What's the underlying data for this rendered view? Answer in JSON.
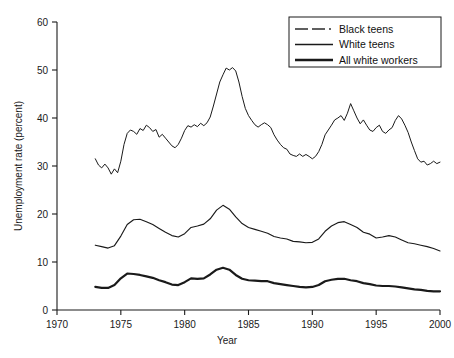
{
  "chart_data": {
    "type": "line",
    "title": "",
    "xlabel": "Year",
    "ylabel": "Unemployment rate (percent)",
    "xlim": [
      1970,
      2000
    ],
    "ylim": [
      0,
      60
    ],
    "xticks": [
      1970,
      1975,
      1980,
      1985,
      1990,
      1995,
      2000
    ],
    "yticks": [
      0,
      10,
      20,
      30,
      40,
      50,
      60
    ],
    "grid": false,
    "legend_position": "top-right",
    "series": [
      {
        "name": "Black teens",
        "style": "dashed",
        "x": [
          1973.0,
          1973.25,
          1973.5,
          1973.75,
          1974.0,
          1974.25,
          1974.5,
          1974.75,
          1975.0,
          1975.25,
          1975.5,
          1975.75,
          1976.0,
          1976.25,
          1976.5,
          1976.75,
          1977.0,
          1977.25,
          1977.5,
          1977.75,
          1978.0,
          1978.25,
          1978.5,
          1978.75,
          1979.0,
          1979.25,
          1979.5,
          1979.75,
          1980.0,
          1980.25,
          1980.5,
          1980.75,
          1981.0,
          1981.25,
          1981.5,
          1981.75,
          1982.0,
          1982.25,
          1982.5,
          1982.75,
          1983.0,
          1983.25,
          1983.5,
          1983.75,
          1984.0,
          1984.25,
          1984.5,
          1984.75,
          1985.0,
          1985.25,
          1985.5,
          1985.75,
          1986.0,
          1986.25,
          1986.5,
          1986.75,
          1987.0,
          1987.25,
          1987.5,
          1987.75,
          1988.0,
          1988.25,
          1988.5,
          1988.75,
          1989.0,
          1989.25,
          1989.5,
          1989.75,
          1990.0,
          1990.25,
          1990.5,
          1990.75,
          1991.0,
          1991.25,
          1991.5,
          1991.75,
          1992.0,
          1992.25,
          1992.5,
          1992.75,
          1993.0,
          1993.25,
          1993.5,
          1993.75,
          1994.0,
          1994.25,
          1994.5,
          1994.75,
          1995.0,
          1995.25,
          1995.5,
          1995.75,
          1996.0,
          1996.25,
          1996.5,
          1996.75,
          1997.0,
          1997.25,
          1997.5,
          1997.75,
          1998.0,
          1998.25,
          1998.5,
          1998.75,
          1999.0,
          1999.25,
          1999.5,
          1999.75,
          2000.0
        ],
        "values": [
          31.5,
          30.2,
          29.6,
          30.4,
          29.6,
          28.3,
          29.4,
          28.6,
          31.0,
          34.5,
          36.8,
          37.5,
          37.2,
          36.6,
          37.8,
          37.4,
          38.5,
          38.0,
          37.2,
          37.6,
          36.0,
          36.6,
          35.8,
          35.0,
          34.2,
          33.8,
          34.5,
          35.8,
          37.4,
          38.4,
          38.1,
          38.6,
          38.2,
          38.9,
          38.4,
          39.0,
          40.2,
          42.5,
          45.0,
          47.5,
          49.0,
          50.4,
          50.0,
          50.5,
          49.8,
          47.5,
          44.5,
          42.0,
          40.5,
          39.5,
          38.6,
          38.1,
          38.6,
          39.0,
          38.6,
          38.0,
          36.5,
          35.4,
          34.5,
          33.8,
          33.5,
          32.5,
          32.2,
          32.0,
          32.5,
          32.0,
          32.4,
          32.0,
          31.5,
          32.0,
          33.0,
          34.5,
          36.5,
          37.5,
          38.5,
          39.6,
          40.0,
          40.5,
          39.5,
          41.0,
          43.0,
          41.5,
          40.0,
          38.8,
          39.6,
          38.5,
          37.5,
          37.2,
          38.0,
          38.5,
          37.2,
          36.8,
          37.5,
          38.0,
          39.5,
          40.5,
          39.8,
          38.5,
          37.0,
          35.0,
          33.2,
          31.5,
          30.8,
          31.0,
          30.2,
          30.5,
          31.0,
          30.5,
          30.8
        ]
      },
      {
        "name": "White teens",
        "style": "thin-solid",
        "x": [
          1973.0,
          1973.5,
          1974.0,
          1974.5,
          1975.0,
          1975.5,
          1976.0,
          1976.5,
          1977.0,
          1977.5,
          1978.0,
          1978.5,
          1979.0,
          1979.5,
          1980.0,
          1980.5,
          1981.0,
          1981.5,
          1982.0,
          1982.5,
          1983.0,
          1983.5,
          1984.0,
          1984.5,
          1985.0,
          1985.5,
          1986.0,
          1986.5,
          1987.0,
          1987.5,
          1988.0,
          1988.5,
          1989.0,
          1989.5,
          1990.0,
          1990.5,
          1991.0,
          1991.5,
          1992.0,
          1992.5,
          1993.0,
          1993.5,
          1994.0,
          1994.5,
          1995.0,
          1995.5,
          1996.0,
          1996.5,
          1997.0,
          1997.5,
          1998.0,
          1998.5,
          1999.0,
          1999.5,
          2000.0
        ],
        "values": [
          13.5,
          13.2,
          12.9,
          13.4,
          15.4,
          17.8,
          18.8,
          18.9,
          18.4,
          17.8,
          17.0,
          16.2,
          15.5,
          15.2,
          15.9,
          17.2,
          17.5,
          17.9,
          19.0,
          20.8,
          21.8,
          21.0,
          19.4,
          18.0,
          17.2,
          16.8,
          16.4,
          16.0,
          15.3,
          15.0,
          14.8,
          14.3,
          14.2,
          14.0,
          14.1,
          14.8,
          16.4,
          17.5,
          18.2,
          18.4,
          17.8,
          17.2,
          16.2,
          15.8,
          15.0,
          15.2,
          15.5,
          15.2,
          14.6,
          14.0,
          13.8,
          13.5,
          13.2,
          12.8,
          12.3
        ]
      },
      {
        "name": "All white workers",
        "style": "thick-solid",
        "x": [
          1973.0,
          1973.5,
          1974.0,
          1974.5,
          1975.0,
          1975.5,
          1976.0,
          1976.5,
          1977.0,
          1977.5,
          1978.0,
          1978.5,
          1979.0,
          1979.5,
          1980.0,
          1980.5,
          1981.0,
          1981.5,
          1982.0,
          1982.5,
          1983.0,
          1983.5,
          1984.0,
          1984.5,
          1985.0,
          1985.5,
          1986.0,
          1986.5,
          1987.0,
          1987.5,
          1988.0,
          1988.5,
          1989.0,
          1989.5,
          1990.0,
          1990.5,
          1991.0,
          1991.5,
          1992.0,
          1992.5,
          1993.0,
          1993.5,
          1994.0,
          1994.5,
          1995.0,
          1995.5,
          1996.0,
          1996.5,
          1997.0,
          1997.5,
          1998.0,
          1998.5,
          1999.0,
          1999.5,
          2000.0
        ],
        "values": [
          4.8,
          4.6,
          4.6,
          5.2,
          6.6,
          7.6,
          7.5,
          7.3,
          7.0,
          6.7,
          6.2,
          5.8,
          5.3,
          5.2,
          5.8,
          6.6,
          6.5,
          6.6,
          7.4,
          8.4,
          8.8,
          8.4,
          7.3,
          6.5,
          6.2,
          6.1,
          6.0,
          6.0,
          5.6,
          5.4,
          5.2,
          5.0,
          4.8,
          4.7,
          4.8,
          5.2,
          6.0,
          6.3,
          6.5,
          6.5,
          6.2,
          6.0,
          5.6,
          5.4,
          5.1,
          5.0,
          5.0,
          4.9,
          4.7,
          4.5,
          4.3,
          4.2,
          4.0,
          3.9,
          3.9
        ]
      }
    ]
  },
  "legend": {
    "items": [
      {
        "label": "Black teens",
        "marker": "dashed-line-swatch"
      },
      {
        "label": "White teens",
        "marker": "thin-line-swatch"
      },
      {
        "label": "All white workers",
        "marker": "thick-line-swatch"
      }
    ]
  }
}
